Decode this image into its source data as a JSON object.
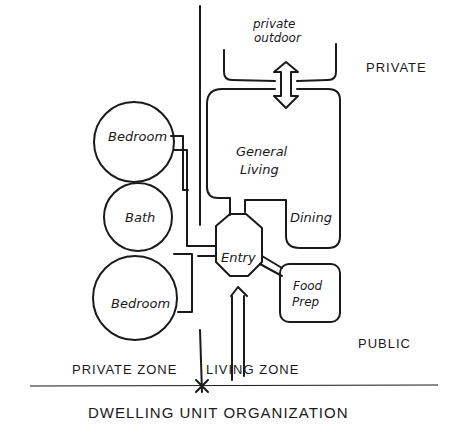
{
  "title": "DWELLING UNIT ORGANIZATION",
  "zones": {
    "private_zone": "PRIVATE ZONE",
    "living_zone": "LIVING ZONE",
    "private": "PRIVATE",
    "public": "PUBLIC"
  },
  "spaces": {
    "private_outdoor_line1": "private",
    "private_outdoor_line2": "outdoor",
    "general_living_line1": "General",
    "general_living_line2": "Living",
    "dining": "Dining",
    "entry": "Entry",
    "food_prep_line1": "Food",
    "food_prep_line2": "Prep",
    "bedroom_top": "Bedroom",
    "bath": "Bath",
    "bedroom_bottom": "Bedroom"
  }
}
